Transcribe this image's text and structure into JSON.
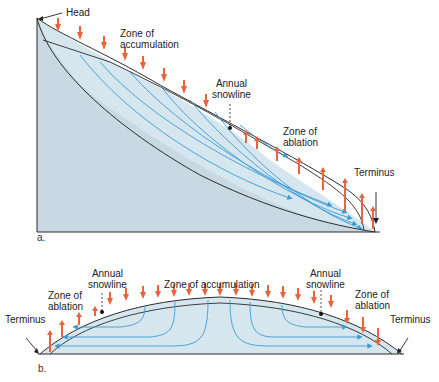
{
  "diagram_a": {
    "panel_label": "a.",
    "labels": {
      "head": "Head",
      "zone_accumulation_1": "Zone of",
      "zone_accumulation_2": "accumulation",
      "snowline_1": "Annual",
      "snowline_2": "snowline",
      "zone_ablation_1": "Zone of",
      "zone_ablation_2": "ablation",
      "terminus": "Terminus"
    }
  },
  "diagram_b": {
    "panel_label": "b.",
    "labels": {
      "zone_ablation_left_1": "Zone of",
      "zone_ablation_left_2": "ablation",
      "snowline_left_1": "Annual",
      "snowline_left_2": "snowline",
      "zone_accumulation": "Zone of accumulation",
      "snowline_right_1": "Annual",
      "snowline_right_2": "snowline",
      "zone_ablation_right_1": "Zone of",
      "zone_ablation_right_2": "ablation",
      "terminus_left": "Terminus",
      "terminus_right": "Terminus"
    }
  },
  "colors": {
    "ground": "#c9d9e3",
    "ice": "#dde9f0",
    "flow_lines": "#3a9bd5",
    "arrows": "#e8643c",
    "outline": "#2b2b2b"
  }
}
